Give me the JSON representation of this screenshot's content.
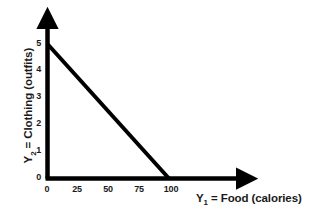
{
  "chart_data": {
    "type": "line",
    "title": "",
    "subtitle": "",
    "xlabel": "Y_1 = Food (calories)",
    "ylabel": "Y_2 = Clothing (outfits)",
    "xlabel_parts": {
      "symbol": "Y",
      "subscript": "1",
      "rest": " = Food (calories)"
    },
    "ylabel_parts": {
      "symbol": "Y",
      "subscript": "2",
      "rest": " = Clothing (outfits)"
    },
    "xlim": [
      0,
      100
    ],
    "ylim": [
      0,
      5
    ],
    "xticks": [
      0,
      25,
      50,
      75,
      100
    ],
    "yticks": [
      0,
      1,
      2,
      3,
      4,
      5
    ],
    "xtick_labels": [
      "0",
      "25",
      "50",
      "75",
      "100"
    ],
    "ytick_labels": [
      "0",
      "1",
      "2",
      "3",
      "4",
      "5"
    ],
    "grid": false,
    "legend": false,
    "legend_position": "none",
    "series": [
      {
        "name": "budget-constraint",
        "type": "line",
        "x": [
          0,
          100
        ],
        "y": [
          5,
          0
        ],
        "color": "#000000",
        "width": 4
      }
    ],
    "annotations": [],
    "axis_style": {
      "arrowheads": true,
      "x_axis_extends_beyond_data": true,
      "y_axis_extends_beyond_data": true,
      "color": "#000000"
    }
  },
  "colors": {
    "background": "#ffffff",
    "line": "#000000",
    "axis": "#000000",
    "text": "#1a1a1a"
  }
}
